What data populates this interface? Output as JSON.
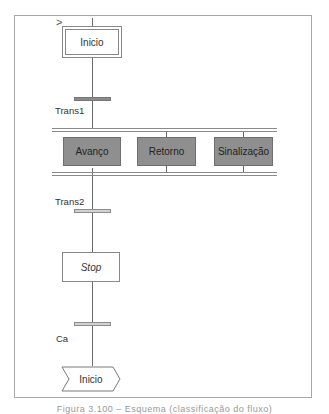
{
  "diagram": {
    "type": "GRAFCET / SFC",
    "start_marker": ">",
    "initial_step": {
      "label": "Inicio"
    },
    "transitions": [
      {
        "id": "trans1",
        "label": "Trans1"
      },
      {
        "id": "trans2",
        "label": "Trans2"
      },
      {
        "id": "ca",
        "label": "Ca"
      }
    ],
    "parallel_branch": {
      "actions": [
        {
          "label": "Avanço"
        },
        {
          "label": "Retorno"
        },
        {
          "label": "Sinalização"
        }
      ]
    },
    "stop_step": {
      "label": "Stop"
    },
    "jump_target": {
      "label": "Inicio"
    },
    "caption": "Figura 3.100 – Esquema (classificação do fluxo)"
  },
  "colors": {
    "action_fill": "#8f8f8f",
    "transition_dark": "#8a8a8a",
    "transition_light": "#d2d2d2",
    "lines": "#6a6a6a",
    "frame": "#a8a8a8"
  }
}
